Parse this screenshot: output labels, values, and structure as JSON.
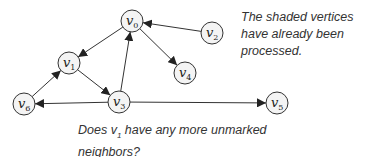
{
  "diagram": {
    "type": "directed-graph",
    "nodes": [
      {
        "id": "v0",
        "label": "v",
        "sub": "0",
        "x": 132,
        "y": 21
      },
      {
        "id": "v1",
        "label": "v",
        "sub": "1",
        "x": 69,
        "y": 63
      },
      {
        "id": "v2",
        "label": "v",
        "sub": "2",
        "x": 212,
        "y": 33
      },
      {
        "id": "v3",
        "label": "v",
        "sub": "3",
        "x": 119,
        "y": 102
      },
      {
        "id": "v4",
        "label": "v",
        "sub": "4",
        "x": 185,
        "y": 73
      },
      {
        "id": "v5",
        "label": "v",
        "sub": "5",
        "x": 277,
        "y": 103
      },
      {
        "id": "v6",
        "label": "v",
        "sub": "6",
        "x": 24,
        "y": 104
      }
    ],
    "edges": [
      {
        "from": "v0",
        "to": "v1"
      },
      {
        "from": "v0",
        "to": "v4"
      },
      {
        "from": "v2",
        "to": "v0"
      },
      {
        "from": "v3",
        "to": "v0"
      },
      {
        "from": "v1",
        "to": "v3"
      },
      {
        "from": "v6",
        "to": "v1"
      },
      {
        "from": "v3",
        "to": "v6"
      },
      {
        "from": "v3",
        "to": "v5"
      }
    ]
  },
  "notes": {
    "top": "The shaded vertices have already been processed.",
    "bottom_prefix": "Does v",
    "bottom_sub": "1",
    "bottom_suffix": " have any more unmarked neighbors?"
  }
}
